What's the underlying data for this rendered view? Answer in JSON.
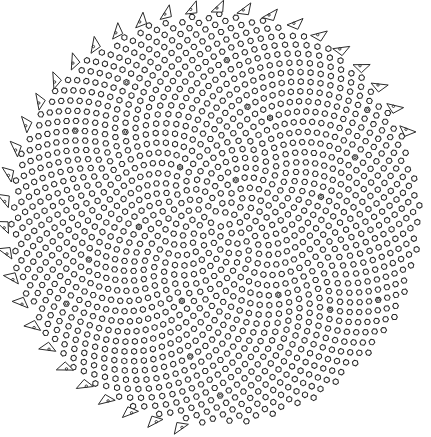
{
  "figure": {
    "width": 431,
    "height": 437,
    "background": "#ffffff",
    "stroke_color": "#2a2a2a",
    "center": [
      215,
      219
    ],
    "radius": 205,
    "floret_count": 1400,
    "golden_angle_deg": 137.508,
    "marked_parastichies": 13,
    "rim_bracts": 34,
    "labels": []
  }
}
